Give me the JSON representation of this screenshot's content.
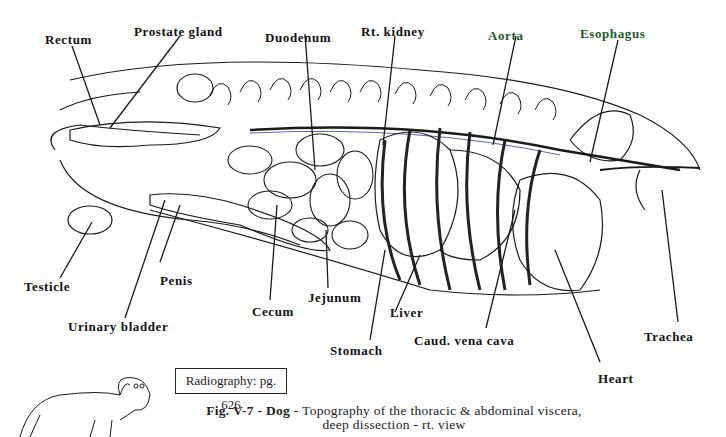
{
  "figure": {
    "id": "Fig. V-7",
    "species": "Dog",
    "caption_line1": "Topography of the thoracic & abdominal viscera,",
    "caption_line2": "deep dissection - rt. view",
    "reference_box": "Radiography: pg. 626"
  },
  "labels": {
    "rectum": "Rectum",
    "prostate_gland": "Prostate gland",
    "duodenum": "Duodenum",
    "rt_kidney": "Rt. kidney",
    "aorta": "Aorta",
    "esophagus": "Esophagus",
    "testicle": "Testicle",
    "penis": "Penis",
    "urinary_bladder": "Urinary bladder",
    "cecum": "Cecum",
    "jejunum": "Jejunum",
    "stomach": "Stomach",
    "liver": "Liver",
    "caud_vena_cava": "Caud. vena cava",
    "heart": "Heart",
    "trachea": "Trachea"
  },
  "colors": {
    "ink": "#111111",
    "aorta_label": "#1f5a2a",
    "vessel_blue": "#3a3aa8"
  }
}
